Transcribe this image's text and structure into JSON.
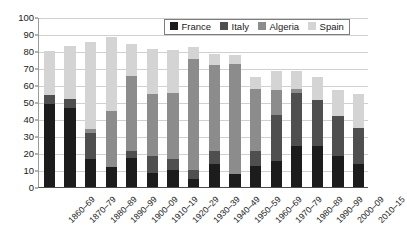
{
  "chart_data": {
    "type": "bar",
    "stacked": true,
    "title": "",
    "subtitle": "",
    "xlabel": "",
    "ylabel": "",
    "ylim": [
      0,
      100
    ],
    "ytick_step": 10,
    "yticks": [
      0,
      10,
      20,
      30,
      40,
      50,
      60,
      70,
      80,
      90,
      100
    ],
    "grid": "horizontal",
    "legend_position": "top-center-inside",
    "categories": [
      "1860–69",
      "1870–79",
      "1880–89",
      "1890–99",
      "1900–09",
      "1910–19",
      "1920–29",
      "1930–39",
      "1940–49",
      "1950–59",
      "1960–69",
      "1970–79",
      "1980–89",
      "1990–99",
      "2000–09",
      "2010–15"
    ],
    "series": [
      {
        "name": "France",
        "color": "#1c1c1c",
        "values": [
          49.0,
          46.5,
          16.5,
          11.5,
          17.0,
          8.0,
          10.0,
          4.5,
          13.5,
          7.5,
          12.5,
          15.5,
          24.0,
          24.0,
          18.5,
          13.5
        ]
      },
      {
        "name": "Italy",
        "color": "#4f4f4f",
        "values": [
          5.0,
          5.5,
          15.5,
          0.0,
          4.0,
          10.5,
          6.5,
          5.5,
          7.5,
          0.0,
          8.5,
          27.0,
          31.5,
          27.0,
          23.0,
          21.0
        ]
      },
      {
        "name": "Algeria",
        "color": "#8c8c8c",
        "values": [
          0.0,
          0.0,
          2.0,
          33.0,
          44.5,
          36.0,
          39.0,
          65.5,
          50.5,
          65.0,
          36.5,
          14.5,
          2.0,
          0.0,
          0.0,
          0.0
        ]
      },
      {
        "name": "Spain",
        "color": "#d4d4d4",
        "values": [
          26.0,
          31.0,
          51.5,
          43.5,
          18.5,
          26.5,
          25.0,
          7.0,
          7.0,
          5.0,
          7.5,
          11.5,
          11.0,
          14.0,
          15.5,
          20.5
        ]
      }
    ],
    "totals": [
      80.0,
      83.0,
      85.5,
      88.0,
      84.0,
      81.0,
      80.5,
      82.5,
      78.5,
      77.5,
      65.0,
      68.5,
      68.5,
      65.0,
      57.0,
      55.0
    ]
  },
  "legend": {
    "items": [
      {
        "label": "France",
        "color": "#1c1c1c"
      },
      {
        "label": "Italy",
        "color": "#4f4f4f"
      },
      {
        "label": "Algeria",
        "color": "#8c8c8c"
      },
      {
        "label": "Spain",
        "color": "#d4d4d4"
      }
    ]
  }
}
